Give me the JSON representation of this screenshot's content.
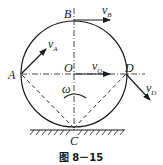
{
  "figure": {
    "caption": "图 8－15",
    "colors": {
      "stroke": "#1a1a1a",
      "background": "#ffffff"
    },
    "points": {
      "A": {
        "label": "A"
      },
      "B": {
        "label": "B"
      },
      "C": {
        "label": "C"
      },
      "D": {
        "label": "D"
      },
      "O": {
        "label": "O"
      }
    },
    "vectors": {
      "vA": {
        "symbol": "v",
        "subscript": "A"
      },
      "vB": {
        "symbol": "v",
        "subscript": "B"
      },
      "vO": {
        "symbol": "v",
        "subscript": "O"
      },
      "vD": {
        "symbol": "v",
        "subscript": "D"
      }
    },
    "angular_velocity": {
      "symbol": "ω"
    }
  }
}
